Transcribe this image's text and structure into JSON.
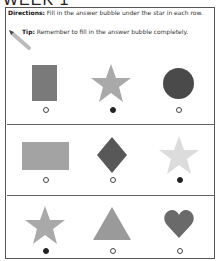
{
  "title": "WEEK 1",
  "directions": {
    "label": "Directions:",
    "text": " Fill in the answer bubble under the star in each row."
  },
  "tip": {
    "label": "Tip:",
    "text": " Remember to fill in the answer bubble completely."
  },
  "rows": [
    {
      "items": [
        {
          "shape": "rectangle-tall",
          "color": "#7a7a7a",
          "selected": false
        },
        {
          "shape": "star",
          "color": "#a9a9a9",
          "selected": true
        },
        {
          "shape": "circle",
          "color": "#4a4a4a",
          "selected": false
        }
      ]
    },
    {
      "items": [
        {
          "shape": "rectangle-wide",
          "color": "#a3a3a3",
          "selected": false
        },
        {
          "shape": "diamond",
          "color": "#585858",
          "selected": false
        },
        {
          "shape": "star",
          "color": "#dcdcdc",
          "selected": true
        }
      ]
    },
    {
      "items": [
        {
          "shape": "star",
          "color": "#a9a9a9",
          "selected": true
        },
        {
          "shape": "triangle",
          "color": "#9a9a9a",
          "selected": false
        },
        {
          "shape": "heart",
          "color": "#6a6a6a",
          "selected": false
        }
      ]
    }
  ]
}
